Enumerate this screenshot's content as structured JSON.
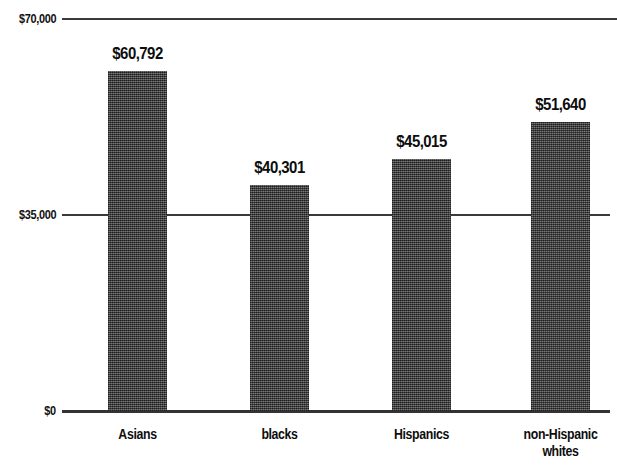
{
  "chart_data": {
    "type": "bar",
    "title": "",
    "subtitle": "",
    "xlabel": "",
    "ylabel": "",
    "categories": [
      "Asians",
      "blacks",
      "Hispanics",
      "non-Hispanic whites"
    ],
    "category_lines": [
      [
        "Asians"
      ],
      [
        "blacks"
      ],
      [
        "Hispanics"
      ],
      [
        "non-Hispanic",
        "whites"
      ]
    ],
    "values": [
      60792,
      45015,
      40301,
      51640
    ],
    "series": [
      {
        "name": "Median household income",
        "values": [
          60792,
          40301,
          45015,
          51640
        ]
      }
    ],
    "value_labels": [
      "$60,792",
      "$40,301",
      "$45,015",
      "$51,640"
    ],
    "ylim": [
      0,
      70000
    ],
    "yticks": [
      0,
      35000,
      70000
    ],
    "ytick_labels": [
      "$0",
      "$35,000",
      "$70,000"
    ],
    "grid": true,
    "legend": false,
    "legend_position": "none",
    "bar_color": "#4b4b4b",
    "axis_color": "#333333",
    "text_color": "#0d0d0d",
    "background": "#ffffff"
  },
  "axis": {
    "y": {
      "ticks": [
        {
          "label": "$70,000",
          "value": 70000
        },
        {
          "label": "$35,000",
          "value": 35000
        },
        {
          "label": "$0",
          "value": 0
        }
      ]
    }
  },
  "bars": [
    {
      "category": "Asians",
      "value_label": "$60,792",
      "line1": "Asians",
      "line2": ""
    },
    {
      "category": "blacks",
      "value_label": "$40,301",
      "line1": "blacks",
      "line2": ""
    },
    {
      "category": "Hispanics",
      "value_label": "$45,015",
      "line1": "Hispanics",
      "line2": ""
    },
    {
      "category": "non-Hispanic whites",
      "value_label": "$51,640",
      "line1": "non-Hispanic",
      "line2": "whites"
    }
  ]
}
